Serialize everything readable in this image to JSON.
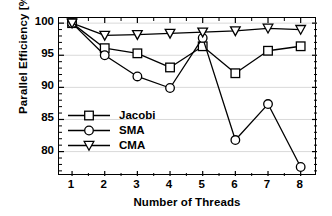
{
  "chart_data": {
    "type": "line",
    "title": "",
    "xlabel": "Number of Threads",
    "ylabel": "Parallel Efficiency [%]",
    "x": [
      1,
      2,
      3,
      4,
      5,
      6,
      7,
      8
    ],
    "xlim": [
      0.6,
      8.5
    ],
    "ylim": [
      76.2,
      100.8
    ],
    "xticks": [
      "1",
      "2",
      "3",
      "4",
      "5",
      "6",
      "7",
      "8"
    ],
    "yticks": [
      "80",
      "85",
      "90",
      "95",
      "100"
    ],
    "ytick_values": [
      80,
      85,
      90,
      95,
      100
    ],
    "grid": "horizontal",
    "grid_color": "#d9d9d9",
    "legend_position": "lower-left-inside",
    "line_color": "#000000",
    "marker_face": "#ffffff",
    "series": [
      {
        "name": "Jacobi",
        "marker": "square",
        "values": [
          100.0,
          96.1,
          95.3,
          93.1,
          96.4,
          92.2,
          95.7,
          96.4
        ]
      },
      {
        "name": "SMA",
        "marker": "circle",
        "values": [
          100.0,
          95.0,
          91.7,
          89.9,
          97.7,
          81.8,
          87.4,
          77.6
        ]
      },
      {
        "name": "CMA",
        "marker": "triangle-down",
        "values": [
          100.0,
          98.1,
          98.2,
          98.4,
          98.6,
          98.8,
          99.2,
          99.0
        ]
      }
    ]
  }
}
